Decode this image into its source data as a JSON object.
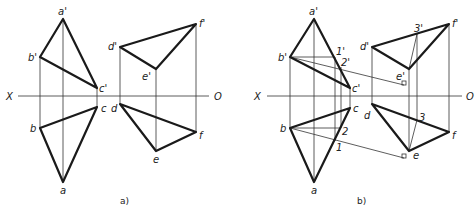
{
  "figure": {
    "panels": [
      {
        "caption": "a)",
        "axis": {
          "left_label": "X",
          "right_label": "O"
        },
        "labels": {
          "a_prime": "a'",
          "b_prime": "b'",
          "c_prime": "c'",
          "a": "a",
          "b": "b",
          "c": "c",
          "d_prime": "d'",
          "e_prime": "e'",
          "f_prime": "f'",
          "d": "d",
          "e": "e",
          "f": "f"
        }
      },
      {
        "caption": "b)",
        "axis": {
          "left_label": "X",
          "right_label": "O"
        },
        "labels": {
          "a_prime": "a'",
          "b_prime": "b'",
          "c_prime": "c'",
          "a": "a",
          "b": "b",
          "c": "c",
          "d_prime": "d'",
          "e_prime": "e'",
          "f_prime": "f'",
          "d": "d",
          "e": "e",
          "f": "f",
          "p1_prime": "1'",
          "p2_prime": "2'",
          "p3_prime": "3'",
          "p1": "1",
          "p2": "2",
          "p3": "3"
        }
      }
    ]
  },
  "colors": {
    "line": "#1a1a1a",
    "background": "#ffffff"
  }
}
